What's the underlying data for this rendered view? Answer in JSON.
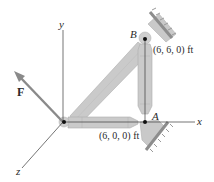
{
  "figure": {
    "axes": {
      "x_label": "x",
      "y_label": "y",
      "z_label": "z"
    },
    "force": {
      "label": "F"
    },
    "points": {
      "A": {
        "label": "A",
        "coord": "(6, 0, 0) ft"
      },
      "B": {
        "label": "B",
        "coord": "(6, 6, 0) ft"
      }
    },
    "members": [
      "OA",
      "AB",
      "OB"
    ],
    "supports": [
      "support at B",
      "support at A"
    ]
  },
  "colors": {
    "member_fill": "#c8c8c8",
    "member_edge": "#a9a9a9",
    "support_hatch": "#9a9a9a",
    "axis": "#333333",
    "force_arrow": "#8a8a8a"
  }
}
